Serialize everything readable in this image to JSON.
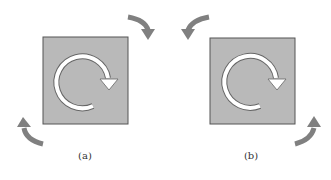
{
  "panels": [
    {
      "id": "a",
      "label": "(a)",
      "inner_rotation": "clockwise",
      "outer_arrows": [
        "top-right-curved-down",
        "bottom-left-curved-up"
      ]
    },
    {
      "id": "b",
      "label": "(b)",
      "inner_rotation": "clockwise",
      "outer_arrows": [
        "top-left-curved-down",
        "bottom-right-curved-up"
      ]
    }
  ],
  "colors": {
    "square_fill": "#b9b9b9",
    "square_border": "#555555",
    "outer_arrow": "#808080",
    "inner_arrow": "#ffffff",
    "background": "#ffffff"
  }
}
